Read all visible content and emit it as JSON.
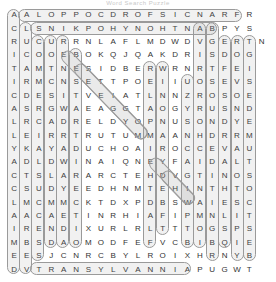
{
  "title": "Word Search Puzzle",
  "grid": {
    "rows": 20,
    "cols": 21,
    "letters": [
      [
        "A",
        "A",
        "L",
        "O",
        "P",
        "P",
        "O",
        "C",
        "D",
        "R",
        "O",
        "F",
        "S",
        "I",
        "C",
        "N",
        "A",
        "R",
        "F",
        "R"
      ],
      [
        "C",
        "L",
        "S",
        "N",
        "I",
        "K",
        "P",
        "O",
        "H",
        "Y",
        "N",
        "O",
        "H",
        "T",
        "N",
        "A",
        "B",
        "P",
        "Y",
        "S"
      ],
      [
        "R",
        "U",
        "C",
        "U",
        "R",
        "R",
        "N",
        "L",
        "A",
        "F",
        "L",
        "M",
        "D",
        "W",
        "D",
        "V",
        "G",
        "E",
        "R",
        "T",
        "N"
      ],
      [
        "I",
        "C",
        "O",
        "O",
        "E",
        "B",
        "O",
        "K",
        "Q",
        "J",
        "Q",
        "A",
        "K",
        "D",
        "R",
        "I",
        "S",
        "D",
        "O",
        "G"
      ],
      [
        "T",
        "A",
        "M",
        "T",
        "N",
        "E",
        "S",
        "I",
        "D",
        "B",
        "E",
        "R",
        "W",
        "R",
        "N",
        "R",
        "T",
        "F",
        "E",
        "I"
      ],
      [
        "I",
        "R",
        "M",
        "C",
        "N",
        "S",
        "E",
        "T",
        "T",
        "P",
        "O",
        "E",
        "I",
        "I",
        "U",
        "O",
        "S",
        "E",
        "V",
        "S"
      ],
      [
        "C",
        "D",
        "E",
        "S",
        "I",
        "T",
        "V",
        "E",
        "I",
        "A",
        "T",
        "L",
        "N",
        "N",
        "Z",
        "R",
        "O",
        "S",
        "O",
        "E"
      ],
      [
        "A",
        "S",
        "R",
        "G",
        "W",
        "A",
        "E",
        "A",
        "G",
        "G",
        "T",
        "A",
        "O",
        "G",
        "Y",
        "R",
        "U",
        "S",
        "N",
        "D"
      ],
      [
        "L",
        "R",
        "C",
        "A",
        "D",
        "R",
        "E",
        "L",
        "D",
        "Y",
        "O",
        "P",
        "N",
        "U",
        "S",
        "O",
        "N",
        "D",
        "Y",
        "E"
      ],
      [
        "L",
        "E",
        "I",
        "R",
        "R",
        "T",
        "R",
        "U",
        "T",
        "U",
        "M",
        "M",
        "A",
        "A",
        "N",
        "H",
        "D",
        "R",
        "R",
        "M"
      ],
      [
        "Y",
        "K",
        "A",
        "Y",
        "A",
        "D",
        "U",
        "C",
        "H",
        "O",
        "A",
        "I",
        "R",
        "O",
        "C",
        "C",
        "E",
        "V",
        "A",
        "U"
      ],
      [
        "A",
        "D",
        "L",
        "D",
        "W",
        "I",
        "N",
        "A",
        "I",
        "Q",
        "N",
        "E",
        "Y",
        "F",
        "A",
        "I",
        "D",
        "A",
        "L",
        "T"
      ],
      [
        "C",
        "T",
        "S",
        "L",
        "A",
        "R",
        "A",
        "R",
        "C",
        "T",
        "E",
        "H",
        "D",
        "V",
        "G",
        "T",
        "I",
        "N",
        "O",
        "S"
      ],
      [
        "C",
        "S",
        "U",
        "D",
        "Y",
        "E",
        "E",
        "D",
        "H",
        "N",
        "M",
        "T",
        "E",
        "H",
        "I",
        "N",
        "T",
        "H",
        "T",
        "O"
      ],
      [
        "L",
        "M",
        "C",
        "M",
        "M",
        "C",
        "K",
        "T",
        "D",
        "X",
        "P",
        "D",
        "B",
        "S",
        "W",
        "A",
        "I",
        "E",
        "S",
        "C"
      ],
      [
        "A",
        "A",
        "C",
        "A",
        "E",
        "T",
        "I",
        "N",
        "R",
        "H",
        "I",
        "A",
        "F",
        "I",
        "P",
        "M",
        "N",
        "L",
        "I",
        "T"
      ],
      [
        "I",
        "R",
        "E",
        "N",
        "D",
        "I",
        "X",
        "U",
        "R",
        "L",
        "R",
        "L",
        "T",
        "T",
        "T",
        "O",
        "G",
        "S",
        "P",
        "S"
      ],
      [
        "M",
        "B",
        "S",
        "D",
        "A",
        "O",
        "M",
        "O",
        "D",
        "F",
        "E",
        "F",
        "V",
        "C",
        "B",
        "I",
        "B",
        "Q",
        "I",
        "E"
      ],
      [
        "E",
        "E",
        "S",
        "J",
        "C",
        "N",
        "R",
        "C",
        "B",
        "Y",
        "L",
        "R",
        "O",
        "I",
        "X",
        "H",
        "R",
        "N",
        "Y",
        "B"
      ],
      [
        "D",
        "V",
        "T",
        "R",
        "A",
        "N",
        "S",
        "Y",
        "L",
        "V",
        "A",
        "N",
        "N",
        "I",
        "A",
        "P",
        "U",
        "G",
        "W",
        "T"
      ]
    ]
  },
  "found_words": [
    "FRANCIS FORD COPPOLA",
    "ANTHONY HOPKINS",
    "CRITICALLY ACCLAIMED",
    "TRANSYLVANNIA",
    "DRACULA",
    "COUNT",
    "HORROR",
    "BRAM STOKER",
    "VAMPIRE",
    "GOTHIC"
  ]
}
